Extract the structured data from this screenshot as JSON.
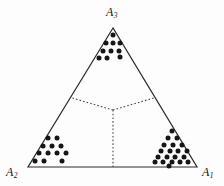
{
  "figure": {
    "type": "ternary-simplex-scatter",
    "background_color": "#fdfdfd",
    "line_color": "#2b2b2b",
    "dot_color": "#161616",
    "dotted_line_color": "#4a4a4a"
  },
  "labels": {
    "a1": {
      "base": "A",
      "sub": "1"
    },
    "a2": {
      "base": "A",
      "sub": "2"
    },
    "a3": {
      "base": "A",
      "sub": "3"
    }
  },
  "chart_data": {
    "type": "scatter",
    "title": "",
    "xlabel": "",
    "ylabel": "",
    "legend": [],
    "grid": false,
    "triangle": {
      "vertices": [
        {
          "name": "A3",
          "x": 113,
          "y": 28
        },
        {
          "name": "A2",
          "x": 28,
          "y": 167
        },
        {
          "name": "A1",
          "x": 197,
          "y": 167
        }
      ],
      "centroid": {
        "x": 113,
        "y": 110
      }
    },
    "partition_lines": [
      {
        "from": "centroid",
        "to": {
          "x": 70.5,
          "y": 97.5
        },
        "style": "dotted"
      },
      {
        "from": "centroid",
        "to": {
          "x": 155.5,
          "y": 97.5
        },
        "style": "dotted"
      },
      {
        "from": "centroid",
        "to": {
          "x": 113,
          "y": 167
        },
        "style": "dotted"
      }
    ],
    "clusters": [
      {
        "name": "cluster-near-A3",
        "count": 10,
        "points": [
          [
            113,
            35
          ],
          [
            106,
            43
          ],
          [
            113,
            43
          ],
          [
            120,
            43
          ],
          [
            103,
            51
          ],
          [
            111,
            51
          ],
          [
            119,
            51
          ],
          [
            99,
            58
          ],
          [
            107,
            58
          ],
          [
            120,
            57
          ]
        ]
      },
      {
        "name": "cluster-near-A2",
        "count": 12,
        "points": [
          [
            48,
            138
          ],
          [
            57,
            138
          ],
          [
            43,
            146
          ],
          [
            52,
            146
          ],
          [
            61,
            146
          ],
          [
            39,
            153
          ],
          [
            48,
            153
          ],
          [
            57,
            153
          ],
          [
            66,
            153
          ],
          [
            35,
            161
          ],
          [
            44,
            161
          ],
          [
            62,
            161
          ]
        ]
      },
      {
        "name": "cluster-near-A1",
        "count": 20,
        "points": [
          [
            172,
            131
          ],
          [
            168,
            138
          ],
          [
            177,
            138
          ],
          [
            164,
            145
          ],
          [
            173,
            145
          ],
          [
            182,
            145
          ],
          [
            161,
            151
          ],
          [
            170,
            151
          ],
          [
            178,
            151
          ],
          [
            187,
            151
          ],
          [
            158,
            157
          ],
          [
            167,
            157
          ],
          [
            175,
            157
          ],
          [
            184,
            157
          ],
          [
            155,
            162
          ],
          [
            163,
            162
          ],
          [
            172,
            162
          ],
          [
            180,
            162
          ],
          [
            188,
            162
          ],
          [
            169,
            166
          ]
        ]
      }
    ]
  }
}
